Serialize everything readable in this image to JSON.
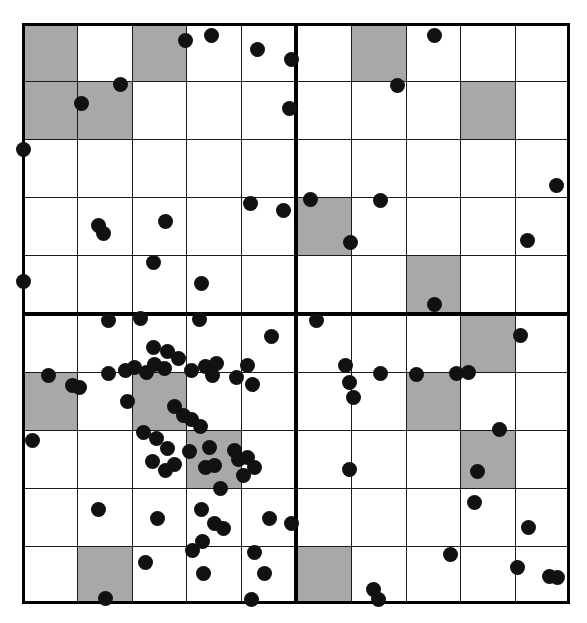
{
  "figure": {
    "title": "",
    "background_color": "#ffffff",
    "shaded_cell_color": "#a8a8a8",
    "grid_line_color": "#1a1a1a",
    "quadrant_divider_color": "#000000",
    "dot_color": "#111111"
  },
  "chart_data": {
    "type": "scatter",
    "title": "",
    "xlabel": "",
    "ylabel": "",
    "grid": true,
    "legend": "none",
    "xlim": [
      0,
      10
    ],
    "ylim": [
      0,
      10
    ],
    "grid_cols": 10,
    "grid_rows": 10,
    "quadrant_divider_col": 5,
    "quadrant_divider_row": 5,
    "xticks": [
      0,
      1,
      2,
      3,
      4,
      5,
      6,
      7,
      8,
      9,
      10
    ],
    "yticks": [
      0,
      1,
      2,
      3,
      4,
      5,
      6,
      7,
      8,
      9,
      10
    ],
    "xtick_labels": [],
    "ytick_labels": [],
    "shaded_cells": [
      [
        0,
        0
      ],
      [
        2,
        0
      ],
      [
        6,
        0
      ],
      [
        0,
        1
      ],
      [
        1,
        1
      ],
      [
        8,
        1
      ],
      [
        5,
        3
      ],
      [
        7,
        4
      ],
      [
        8,
        5
      ],
      [
        0,
        6
      ],
      [
        2,
        6
      ],
      [
        7,
        6
      ],
      [
        3,
        7
      ],
      [
        8,
        7
      ],
      [
        1,
        9
      ],
      [
        5,
        9
      ]
    ],
    "point_radius_px": 7.5,
    "n_points": 104,
    "points": [
      [
        2.99,
        9.7
      ],
      [
        3.45,
        9.78
      ],
      [
        4.3,
        9.55
      ],
      [
        4.92,
        9.38
      ],
      [
        7.53,
        9.78
      ],
      [
        1.8,
        8.95
      ],
      [
        1.08,
        8.62
      ],
      [
        6.85,
        8.92
      ],
      [
        4.88,
        8.52
      ],
      [
        0.02,
        7.82
      ],
      [
        4.17,
        6.9
      ],
      [
        4.78,
        6.78
      ],
      [
        5.26,
        6.96
      ],
      [
        6.54,
        6.94
      ],
      [
        9.76,
        7.2
      ],
      [
        1.4,
        6.52
      ],
      [
        1.48,
        6.38
      ],
      [
        2.62,
        6.58
      ],
      [
        6.0,
        6.22
      ],
      [
        9.22,
        6.25
      ],
      [
        2.4,
        5.88
      ],
      [
        0.03,
        5.55
      ],
      [
        3.28,
        5.52
      ],
      [
        7.52,
        5.15
      ],
      [
        1.58,
        4.88
      ],
      [
        2.17,
        4.92
      ],
      [
        3.23,
        4.9
      ],
      [
        5.38,
        4.88
      ],
      [
        4.55,
        4.6
      ],
      [
        2.4,
        4.42
      ],
      [
        2.65,
        4.35
      ],
      [
        2.85,
        4.22
      ],
      [
        1.88,
        4.02
      ],
      [
        2.05,
        4.07
      ],
      [
        2.28,
        3.98
      ],
      [
        2.42,
        4.12
      ],
      [
        2.6,
        4.05
      ],
      [
        3.1,
        4.02
      ],
      [
        3.35,
        4.08
      ],
      [
        3.55,
        4.14
      ],
      [
        3.47,
        3.93
      ],
      [
        3.92,
        3.9
      ],
      [
        4.12,
        4.1
      ],
      [
        4.2,
        3.78
      ],
      [
        0.48,
        3.94
      ],
      [
        0.92,
        3.76
      ],
      [
        1.05,
        3.72
      ],
      [
        1.58,
        3.96
      ],
      [
        5.9,
        4.1
      ],
      [
        5.98,
        3.82
      ],
      [
        6.05,
        3.55
      ],
      [
        8.15,
        3.98
      ],
      [
        6.55,
        3.96
      ],
      [
        7.2,
        3.95
      ],
      [
        7.92,
        3.96
      ],
      [
        9.1,
        4.62
      ],
      [
        1.92,
        3.48
      ],
      [
        2.78,
        3.4
      ],
      [
        2.95,
        3.25
      ],
      [
        3.1,
        3.18
      ],
      [
        3.25,
        3.05
      ],
      [
        2.22,
        2.95
      ],
      [
        2.45,
        2.85
      ],
      [
        8.72,
        3.0
      ],
      [
        0.2,
        2.82
      ],
      [
        2.65,
        2.68
      ],
      [
        3.05,
        2.62
      ],
      [
        3.42,
        2.7
      ],
      [
        2.38,
        2.45
      ],
      [
        2.62,
        2.3
      ],
      [
        2.78,
        2.4
      ],
      [
        3.35,
        2.35
      ],
      [
        3.52,
        2.38
      ],
      [
        3.95,
        2.48
      ],
      [
        4.12,
        2.52
      ],
      [
        4.25,
        2.35
      ],
      [
        4.05,
        2.22
      ],
      [
        3.88,
        2.65
      ],
      [
        5.98,
        2.32
      ],
      [
        8.32,
        2.28
      ],
      [
        3.62,
        1.98
      ],
      [
        1.4,
        1.62
      ],
      [
        2.48,
        1.48
      ],
      [
        3.28,
        1.62
      ],
      [
        3.52,
        1.38
      ],
      [
        3.68,
        1.3
      ],
      [
        4.52,
        1.48
      ],
      [
        4.92,
        1.38
      ],
      [
        8.25,
        1.75
      ],
      [
        9.25,
        1.32
      ],
      [
        3.3,
        1.08
      ],
      [
        3.12,
        0.92
      ],
      [
        4.25,
        0.88
      ],
      [
        2.25,
        0.72
      ],
      [
        3.32,
        0.52
      ],
      [
        4.42,
        0.52
      ],
      [
        1.52,
        0.1
      ],
      [
        4.18,
        0.08
      ],
      [
        6.42,
        0.25
      ],
      [
        6.5,
        0.08
      ],
      [
        9.05,
        0.62
      ],
      [
        9.62,
        0.48
      ],
      [
        9.78,
        0.45
      ],
      [
        7.82,
        0.85
      ]
    ]
  }
}
